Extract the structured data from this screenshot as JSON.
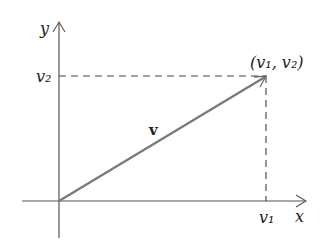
{
  "diagram": {
    "axes": {
      "x_label": "x",
      "y_label": "y",
      "color": "#555555"
    },
    "vector": {
      "label": "v",
      "color": "#7a7a7a",
      "tip_label": "(v₁, v₂)"
    },
    "ticks": {
      "x_component_label": "v₁",
      "y_component_label": "v₂"
    },
    "guides": {
      "style": "dashed",
      "color": "#444444"
    }
  }
}
